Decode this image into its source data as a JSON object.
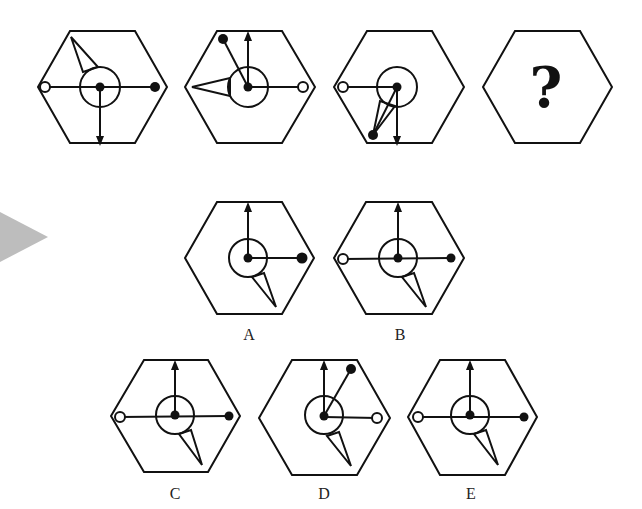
{
  "puzzle": {
    "type": "figure-sequence",
    "sequence": [
      {
        "id": "seq-1",
        "center": [
          100,
          87
        ],
        "vector_arrow": "down",
        "open_dot": "left",
        "filled_dot": "right",
        "extra_line_to": null,
        "spike_direction": "up-left"
      },
      {
        "id": "seq-2",
        "center": [
          247,
          87
        ],
        "vector_arrow": "up",
        "open_dot": "right",
        "filled_dot": "up-left",
        "extra_line_to": null,
        "spike_direction": "left"
      },
      {
        "id": "seq-3",
        "center": [
          397,
          87
        ],
        "vector_arrow": "down",
        "open_dot": "left",
        "filled_dot": "down-left",
        "extra_line_to": null,
        "spike_direction": "down-left"
      },
      {
        "id": "seq-4",
        "center": [
          546,
          87
        ],
        "placeholder": "?"
      }
    ],
    "options": [
      {
        "label": "A",
        "center": [
          248,
          258
        ],
        "vector_arrow": "up",
        "open_dot": null,
        "filled_dot": "right",
        "spike_direction": "down-right"
      },
      {
        "label": "B",
        "center": [
          398,
          258
        ],
        "vector_arrow": "up",
        "open_dot": "left",
        "filled_dot": "right",
        "spike_direction": "down-right"
      },
      {
        "label": "C",
        "center": [
          175,
          415
        ],
        "vector_arrow": "up",
        "open_dot": "left",
        "filled_dot": "right",
        "spike_direction": "down-right"
      },
      {
        "label": "D",
        "center": [
          323,
          415
        ],
        "vector_arrow": "up",
        "open_dot": "right",
        "filled_dot": "up-right",
        "spike_direction": "down-right"
      },
      {
        "label": "E",
        "center": [
          470,
          415
        ],
        "vector_arrow": "up",
        "open_dot": "left",
        "filled_dot": "right",
        "spike_direction": "down-right"
      }
    ],
    "question_mark": "?",
    "side_arrow": "play-arrow",
    "colors": {
      "stroke": "#111111",
      "background": "#ffffff",
      "side_arrow": "#bdbdbd"
    }
  }
}
